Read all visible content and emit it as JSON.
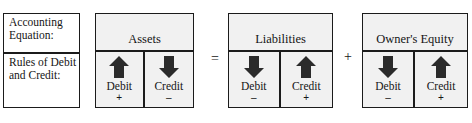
{
  "diagram": {
    "colors": {
      "border": "#1b1b1b",
      "cell_fill": "#f1f1f1",
      "label_fill": "#ffffff",
      "arrow_fill": "#2b2b2b",
      "text": "#151515"
    }
  },
  "label_box": {
    "top_label": "Accounting Equation:",
    "bottom_label": "Rules of Debit and Credit:"
  },
  "operators": {
    "equals": "=",
    "plus": "+"
  },
  "accounts": [
    {
      "name": "Assets",
      "debit": {
        "label": "Debit",
        "sign": "+",
        "arrow": "up-arrow-icon"
      },
      "credit": {
        "label": "Credit",
        "sign": "–",
        "arrow": "down-arrow-icon"
      }
    },
    {
      "name": "Liabilities",
      "debit": {
        "label": "Debit",
        "sign": "–",
        "arrow": "down-arrow-icon"
      },
      "credit": {
        "label": "Credit",
        "sign": "+",
        "arrow": "up-arrow-icon"
      }
    },
    {
      "name": "Owner's Equity",
      "debit": {
        "label": "Debit",
        "sign": "–",
        "arrow": "down-arrow-icon"
      },
      "credit": {
        "label": "Credit",
        "sign": "+",
        "arrow": "up-arrow-icon"
      }
    }
  ]
}
